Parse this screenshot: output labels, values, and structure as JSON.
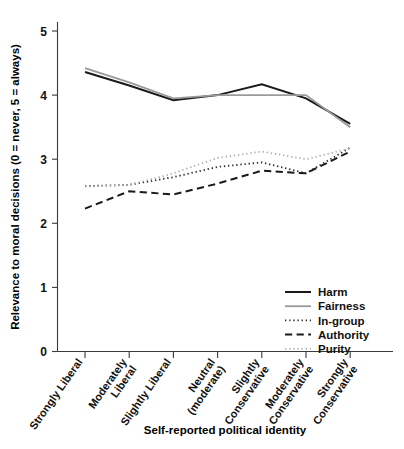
{
  "chart_data": {
    "type": "line",
    "title": "",
    "xlabel": "Self-reported political identity",
    "ylabel": "Relevance to moral decisions (0 = never, 5 = always)",
    "ylim": [
      0,
      5.3
    ],
    "yticks": [
      0,
      1,
      2,
      3,
      4,
      5
    ],
    "ytick_labels": [
      "0",
      "1",
      "2",
      "3",
      "4",
      "5"
    ],
    "grid": false,
    "legend_position": "bottom-right inside axes",
    "categories": [
      "Strongly Liberal",
      "Moderately Liberal",
      "Slightly Liberal",
      "Neutral (moderate)",
      "Slightly Conservative",
      "Moderately Conservative",
      "Strongly Conservative"
    ],
    "series": [
      {
        "name": "Harm",
        "style": "solid",
        "color": "#1a1a1a",
        "width": 2.0,
        "values": [
          4.36,
          4.15,
          3.92,
          4.0,
          4.17,
          3.95,
          3.55
        ]
      },
      {
        "name": "Fairness",
        "style": "solid",
        "color": "#9a9a9a",
        "width": 1.8,
        "values": [
          4.42,
          4.2,
          3.95,
          4.0,
          4.0,
          4.0,
          3.5
        ]
      },
      {
        "name": "In-group",
        "style": "dotted",
        "color": "#2b2b2b",
        "width": 1.8,
        "values": [
          2.58,
          2.6,
          2.72,
          2.88,
          2.95,
          2.78,
          3.18
        ]
      },
      {
        "name": "Authority",
        "style": "dashed",
        "color": "#1a1a1a",
        "width": 2.0,
        "values": [
          2.23,
          2.5,
          2.45,
          2.62,
          2.82,
          2.78,
          3.12
        ]
      },
      {
        "name": "Purity",
        "style": "dotted",
        "color": "#b0b0b0",
        "width": 1.8,
        "values": [
          2.57,
          2.6,
          2.78,
          3.02,
          3.12,
          3.0,
          3.17
        ]
      }
    ]
  },
  "legend": {
    "items": [
      {
        "label": "Harm"
      },
      {
        "label": "Fairness"
      },
      {
        "label": "In-group"
      },
      {
        "label": "Authority"
      },
      {
        "label": "Purity"
      }
    ]
  }
}
